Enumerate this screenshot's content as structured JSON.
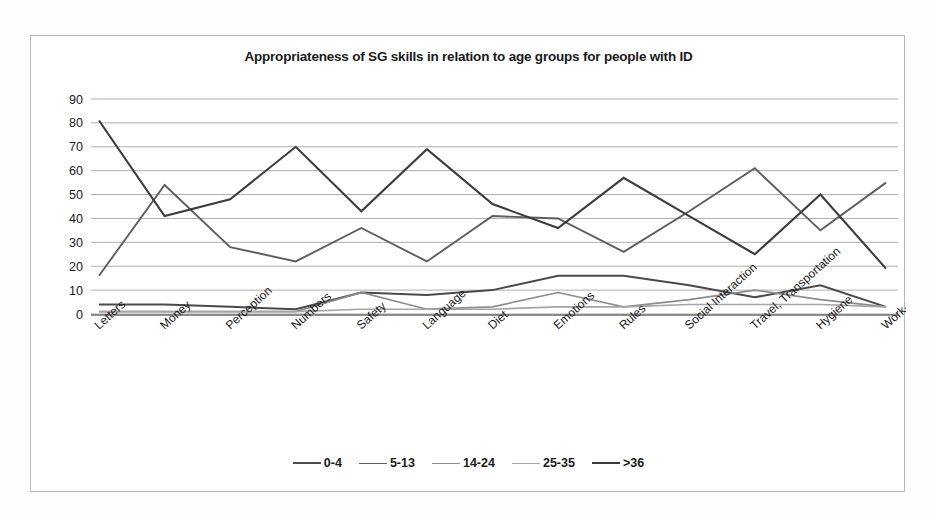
{
  "chart_data": {
    "type": "line",
    "title": "Appropriateness of SG skills in relation to age groups for people with ID",
    "xlabel": "",
    "ylabel": "",
    "ylim": [
      0,
      90
    ],
    "ytick_step": 10,
    "yticks": [
      "90",
      "80",
      "70",
      "60",
      "50",
      "40",
      "30",
      "20",
      "10",
      "0"
    ],
    "grid": true,
    "legend_position": "bottom",
    "categories": [
      "Letters",
      "Money",
      "Perception",
      "Numbers",
      "Safety",
      "Language",
      "Diet",
      "Emotions",
      "Rules",
      "Social Interaction",
      "Travel, Transportation",
      "Hygiene",
      "Work-related"
    ],
    "series": [
      {
        "name": "0-4",
        "color": "#4a4a4a",
        "width": 2.0,
        "values": [
          4,
          4,
          3,
          2,
          9,
          8,
          10,
          16,
          16,
          12,
          7,
          12,
          3
        ]
      },
      {
        "name": "5-13",
        "color": "#5e5e5e",
        "width": 1.9,
        "values": [
          16,
          54,
          28,
          22,
          36,
          22,
          41,
          40,
          26,
          43,
          61,
          35,
          55
        ]
      },
      {
        "name": "14-24",
        "color": "#8d8d8d",
        "width": 1.7,
        "values": [
          1,
          1,
          1,
          1,
          9,
          2,
          3,
          9,
          3,
          6,
          10,
          6,
          3
        ]
      },
      {
        "name": "25-35",
        "color": "#a5a5a5",
        "width": 1.6,
        "values": [
          1,
          1,
          1,
          1,
          2,
          2,
          2,
          3,
          3,
          4,
          4,
          4,
          3
        ]
      },
      {
        "name": ">36",
        "color": "#3c3c3c",
        "width": 2.1,
        "values": [
          81,
          41,
          48,
          70,
          43,
          69,
          46,
          36,
          57,
          41,
          25,
          50,
          19
        ]
      }
    ]
  },
  "legend": {
    "items": [
      {
        "label": "0-4"
      },
      {
        "label": "5-13"
      },
      {
        "label": "14-24"
      },
      {
        "label": "25-35"
      },
      {
        "label": ">36"
      }
    ]
  }
}
